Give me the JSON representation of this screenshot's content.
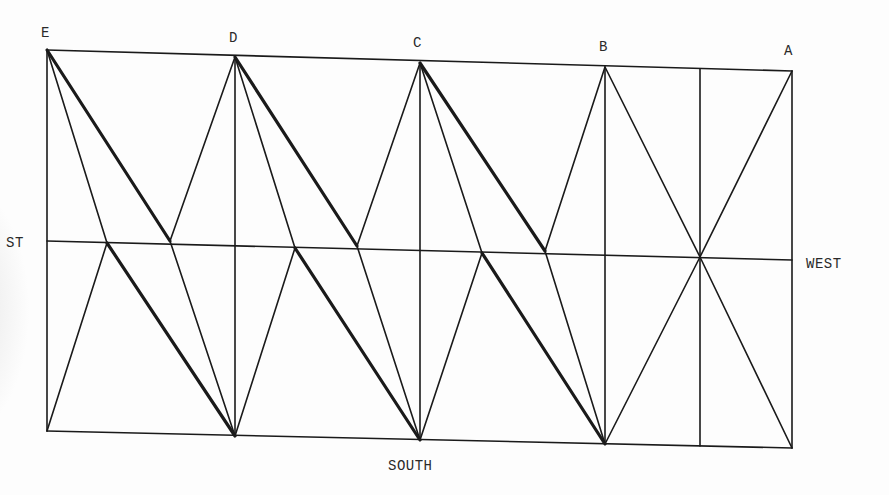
{
  "diagram": {
    "stroke_color": "#1a1a1a",
    "thin_width": 1.6,
    "thick_width": 3.2,
    "labels": {
      "E": "E",
      "D": "D",
      "C": "C",
      "B": "B",
      "A": "A",
      "west_left": "ST",
      "west_right": "WEST",
      "south": "SOUTH"
    },
    "points": {
      "E": [
        47,
        50
      ],
      "D": [
        235,
        57
      ],
      "C": [
        420,
        63
      ],
      "B": [
        605,
        67
      ],
      "A": [
        792,
        71
      ],
      "midL": [
        47,
        241
      ],
      "midR": [
        792,
        260
      ],
      "m1": [
        107,
        243
      ],
      "m2": [
        170,
        241
      ],
      "m3": [
        295,
        248
      ],
      "m4": [
        357,
        246
      ],
      "m5": [
        482,
        253
      ],
      "m6": [
        545,
        251
      ],
      "m7": [
        700,
        257
      ],
      "b0": [
        47,
        431
      ],
      "b1": [
        235,
        436
      ],
      "b2": [
        420,
        440
      ],
      "b3": [
        605,
        444
      ],
      "b4": [
        792,
        448
      ],
      "t7": [
        700,
        69
      ],
      "bb7": [
        700,
        446
      ]
    },
    "segments": [
      {
        "from": "E",
        "to": "A",
        "weight": "thin",
        "role": "top-edge"
      },
      {
        "from": "midL",
        "to": "midR",
        "weight": "thin",
        "role": "middle-line"
      },
      {
        "from": "b0",
        "to": "b4",
        "weight": "thin",
        "role": "bottom-edge"
      },
      {
        "from": "E",
        "to": "b0",
        "weight": "thin",
        "role": "vertical"
      },
      {
        "from": "D",
        "to": "b1",
        "weight": "thin",
        "role": "vertical"
      },
      {
        "from": "C",
        "to": "b2",
        "weight": "thin",
        "role": "vertical"
      },
      {
        "from": "B",
        "to": "b3",
        "weight": "thin",
        "role": "vertical"
      },
      {
        "from": "t7",
        "to": "bb7",
        "weight": "thin",
        "role": "vertical"
      },
      {
        "from": "A",
        "to": "b4",
        "weight": "thin",
        "role": "vertical"
      },
      {
        "from": "E",
        "to": "m2",
        "weight": "thick"
      },
      {
        "from": "E",
        "to": "m1",
        "weight": "thin"
      },
      {
        "from": "D",
        "to": "m2",
        "weight": "thin"
      },
      {
        "from": "m1",
        "to": "b0",
        "weight": "thin"
      },
      {
        "from": "m1",
        "to": "b1",
        "weight": "thick"
      },
      {
        "from": "m2",
        "to": "b1",
        "weight": "thin"
      },
      {
        "from": "D",
        "to": "m4",
        "weight": "thick"
      },
      {
        "from": "D",
        "to": "m3",
        "weight": "thin"
      },
      {
        "from": "C",
        "to": "m4",
        "weight": "thin"
      },
      {
        "from": "m3",
        "to": "b1",
        "weight": "thin"
      },
      {
        "from": "m3",
        "to": "b2",
        "weight": "thick"
      },
      {
        "from": "m4",
        "to": "b2",
        "weight": "thin"
      },
      {
        "from": "C",
        "to": "m6",
        "weight": "thick"
      },
      {
        "from": "C",
        "to": "m5",
        "weight": "thin"
      },
      {
        "from": "B",
        "to": "m6",
        "weight": "thin"
      },
      {
        "from": "m5",
        "to": "b2",
        "weight": "thin"
      },
      {
        "from": "m5",
        "to": "b3",
        "weight": "thick"
      },
      {
        "from": "m6",
        "to": "b3",
        "weight": "thin"
      },
      {
        "from": "B",
        "to": "m7",
        "weight": "thin"
      },
      {
        "from": "A",
        "to": "m7",
        "weight": "thin"
      },
      {
        "from": "m7",
        "to": "b3",
        "weight": "thin"
      },
      {
        "from": "m7",
        "to": "b4",
        "weight": "thin"
      }
    ]
  }
}
